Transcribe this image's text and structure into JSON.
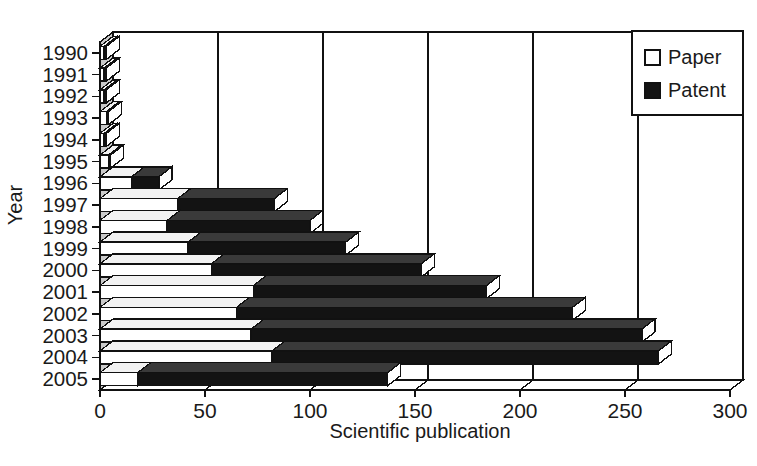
{
  "chart_data": {
    "type": "bar",
    "orientation": "horizontal",
    "stacked": true,
    "style": "3d",
    "title": "",
    "xlabel": "Scientific publication",
    "ylabel": "Year",
    "xlim": [
      0,
      300
    ],
    "xticks": [
      0,
      50,
      100,
      150,
      200,
      250,
      300
    ],
    "grid": true,
    "legend_position": "top-right",
    "categories": [
      "1990",
      "1991",
      "1992",
      "1993",
      "1994",
      "1995",
      "1996",
      "1997",
      "1998",
      "1999",
      "2000",
      "2001",
      "2002",
      "2003",
      "2004",
      "2005"
    ],
    "series": [
      {
        "name": "Paper",
        "color": "#ffffff",
        "values": [
          2,
          2,
          2,
          3,
          2,
          4,
          15,
          37,
          32,
          42,
          53,
          73,
          65,
          72,
          82,
          18
        ]
      },
      {
        "name": "Patent",
        "color": "#131313",
        "values": [
          1,
          1,
          1,
          1,
          1,
          1,
          13,
          46,
          68,
          75,
          100,
          111,
          160,
          186,
          184,
          119
        ]
      }
    ],
    "totals": [
      3,
      3,
      3,
      4,
      3,
      5,
      28,
      83,
      100,
      117,
      153,
      184,
      225,
      258,
      266,
      137
    ]
  },
  "legend": {
    "entries": [
      {
        "label": "Paper",
        "swatch": "open-square"
      },
      {
        "label": "Patent",
        "swatch": "filled-square"
      }
    ]
  },
  "axis": {
    "x_title": "Scientific publication",
    "y_title": "Year",
    "x_tick_labels": [
      "0",
      "50",
      "100",
      "150",
      "200",
      "250",
      "300"
    ],
    "y_tick_labels": [
      "1990",
      "1991",
      "1992",
      "1993",
      "1994",
      "1995",
      "1996",
      "1997",
      "1998",
      "1999",
      "2000",
      "2001",
      "2002",
      "2003",
      "2004",
      "2005"
    ]
  }
}
